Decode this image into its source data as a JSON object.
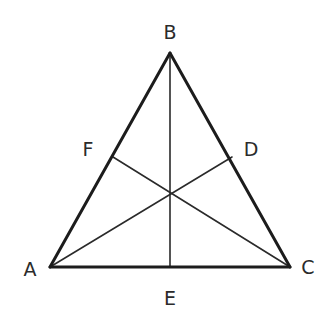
{
  "diagram": {
    "type": "triangle-with-cevians",
    "stroke_color": "#1c1c1c",
    "label_color": "#2b2b2b",
    "vertices": {
      "A": {
        "label": "A",
        "x": 50,
        "y": 267,
        "label_x": 30,
        "label_y": 270
      },
      "B": {
        "label": "B",
        "x": 170,
        "y": 53,
        "label_x": 170,
        "label_y": 33
      },
      "C": {
        "label": "C",
        "x": 290,
        "y": 267,
        "label_x": 308,
        "label_y": 268
      }
    },
    "side_points": {
      "D": {
        "label": "D",
        "x": 232,
        "y": 157,
        "on_side": "BC",
        "label_x": 251,
        "label_y": 150
      },
      "E": {
        "label": "E",
        "x": 170,
        "y": 267,
        "on_side": "AC",
        "label_x": 170,
        "label_y": 299
      },
      "F": {
        "label": "F",
        "x": 113,
        "y": 157,
        "on_side": "AB",
        "label_x": 88,
        "label_y": 150
      }
    },
    "sides": [
      {
        "from": "A",
        "to": "B"
      },
      {
        "from": "B",
        "to": "C"
      },
      {
        "from": "C",
        "to": "A"
      }
    ],
    "cevians": [
      {
        "from": "A",
        "to": "D"
      },
      {
        "from": "B",
        "to": "E"
      },
      {
        "from": "C",
        "to": "F"
      }
    ],
    "labels": {
      "A": "A",
      "B": "B",
      "C": "C",
      "D": "D",
      "E": "E",
      "F": "F"
    }
  }
}
